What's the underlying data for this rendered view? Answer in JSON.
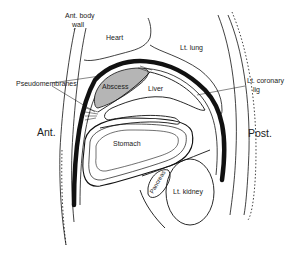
{
  "diagram": {
    "type": "anatomical cross-section",
    "labels": {
      "ant_body_wall_line1": "Ant. body",
      "ant_body_wall_line2": "wall",
      "heart": "Heart",
      "lt_lung": "Lt. lung",
      "pseudomembranes": "Pseudomembranes",
      "abscess": "Abscess",
      "liver": "Liver",
      "lt_coronary_lig_line1": "Lt. coronary",
      "lt_coronary_lig_line2": "lig",
      "ant": "Ant.",
      "post": "Post.",
      "stomach": "Stomach",
      "pancreas": "Pancreas",
      "lt_kidney": "Lt. kidney"
    },
    "colors": {
      "line": "#111111",
      "abscess_fill": "#b5b5b5",
      "background": "#ffffff"
    }
  }
}
